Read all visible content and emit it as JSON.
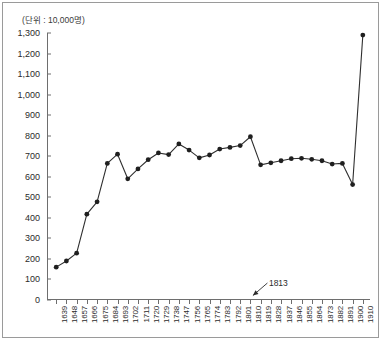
{
  "figure": {
    "unit_caption": "(단위 : 10,000명)",
    "frame_color": "#9a9a9a",
    "axis_color": "#6e6e6e",
    "series_color": "#2f2f2f",
    "marker_color": "#1f1f1f",
    "background": "#ffffff"
  },
  "annotations": [
    {
      "name": "annotation-1813",
      "label": "1813",
      "points_to_year": "1813"
    }
  ],
  "chart_data": {
    "type": "line",
    "title": "",
    "subtitle": "",
    "xlabel": "",
    "ylabel": "",
    "unit_note": "(단위 : 10,000명)",
    "grid": false,
    "legend": "none",
    "ylim": [
      0,
      1300
    ],
    "ytick_step": 100,
    "ytick_labels": [
      "0",
      "100",
      "200",
      "300",
      "400",
      "500",
      "600",
      "700",
      "800",
      "900",
      "1,000",
      "1,100",
      "1,200",
      "1,300"
    ],
    "ytick_values": [
      0,
      100,
      200,
      300,
      400,
      500,
      600,
      700,
      800,
      900,
      1000,
      1100,
      1200,
      1300
    ],
    "categories": [
      "1639",
      "1648",
      "1657",
      "1666",
      "1675",
      "1684",
      "1693",
      "1702",
      "1711",
      "1720",
      "1729",
      "1738",
      "1747",
      "1756",
      "1765",
      "1774",
      "1783",
      "1792",
      "1801",
      "1810",
      "1819",
      "1828",
      "1837",
      "1846",
      "1855",
      "1864",
      "1873",
      "1882",
      "1891",
      "1900",
      "1910"
    ],
    "values": [
      160,
      190,
      228,
      418,
      478,
      665,
      710,
      590,
      638,
      683,
      716,
      708,
      760,
      730,
      692,
      706,
      735,
      743,
      752,
      795,
      658,
      668,
      678,
      688,
      690,
      685,
      678,
      662,
      665,
      562,
      1290
    ],
    "series": [
      {
        "name": "population",
        "values": [
          160,
          190,
          228,
          418,
          478,
          665,
          710,
          590,
          638,
          683,
          716,
          708,
          760,
          730,
          692,
          706,
          735,
          743,
          752,
          795,
          658,
          668,
          678,
          688,
          690,
          685,
          678,
          662,
          665,
          562,
          1290
        ]
      }
    ],
    "marker": "filled-circle",
    "annotation_labels": [
      "1813"
    ]
  }
}
